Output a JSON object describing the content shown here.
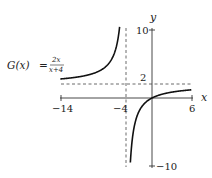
{
  "chart_data": {
    "type": "line",
    "function_label": {
      "name": "G(x)",
      "equals": "=",
      "numerator": "2x",
      "denominator": "x+4"
    },
    "xlabel": "x",
    "ylabel": "y",
    "xlim": [
      -14,
      6
    ],
    "ylim": [
      -10,
      10
    ],
    "x_ticks": [
      {
        "value": -14,
        "label": "−14"
      },
      {
        "value": -4,
        "label": "−4"
      },
      {
        "value": 6,
        "label": "6"
      }
    ],
    "y_ticks": [
      {
        "value": 10,
        "label": "10"
      },
      {
        "value": 2,
        "label": "2"
      },
      {
        "value": -10,
        "label": "−10"
      }
    ],
    "asymptotes": {
      "vertical": {
        "x": -4,
        "style": "dashed"
      },
      "horizontal": {
        "y": 2,
        "style": "dashed"
      }
    },
    "series": [
      {
        "name": "left branch",
        "x": [
          -14,
          -12,
          -10,
          -8,
          -6,
          -5,
          -4.8
        ],
        "values": [
          2.8,
          3.0,
          3.33,
          4.0,
          6.0,
          10.0,
          12.0
        ]
      },
      {
        "name": "right branch",
        "x": [
          -3.3,
          -3.0,
          -2.0,
          -1.0,
          0,
          2,
          4,
          6
        ],
        "values": [
          -9.4,
          -6.0,
          -2.0,
          -0.67,
          0,
          0.67,
          1.0,
          1.2
        ]
      }
    ],
    "grid": false,
    "legend": "none"
  }
}
